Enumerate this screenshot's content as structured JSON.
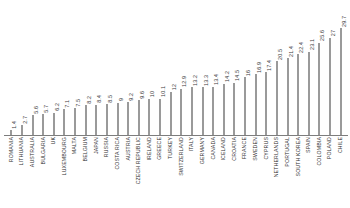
{
  "chart_data": {
    "type": "bar",
    "title": "",
    "xlabel": "",
    "ylabel": "",
    "grid": false,
    "legend": false,
    "ylim": [
      0,
      29.7
    ],
    "orientation": "vertical",
    "bar_color": "#9a9a9a",
    "axis_color": "#7d7d7d",
    "label_rotation": 90,
    "value_labels_shown": true,
    "categories": [
      "ROMANIA",
      "LITHUANIA",
      "AUSTRALIA",
      "BULGARIA",
      "UK",
      "LUXEMBOURG",
      "MALTA",
      "BELGIUM",
      "JAPAN",
      "RUSSIA",
      "COSTA RICA",
      "AUSTRIA",
      "CZECH REPUBLIC",
      "IRELAND",
      "GREECE",
      "TURKEY",
      "SWITZERLAND",
      "ITALY",
      "GERMANY",
      "CANADA",
      "ICELAND",
      "CROATIA",
      "FRANCE",
      "SWEDEN",
      "CYPRUS",
      "NETHERLANDS",
      "PORTUGAL",
      "SOUTH KOREA",
      "SPAIN",
      "COLOMBIA",
      "POLAND",
      "CHILE"
    ],
    "values": [
      1.4,
      2.7,
      5.6,
      5.7,
      6.2,
      7.1,
      7.5,
      8.2,
      8.4,
      8.5,
      9,
      9.2,
      9.6,
      10,
      10.1,
      12,
      12.9,
      13.2,
      13.3,
      13.4,
      14.2,
      14.5,
      16,
      16.9,
      17.4,
      20.5,
      21.4,
      22.4,
      23.1,
      25.6,
      27,
      29.7
    ],
    "value_labels": [
      "1.4",
      "2.7",
      "5.6",
      "5.7",
      "6.2",
      "7.1",
      "7.5",
      "8.2",
      "8.4",
      "8.5",
      "9",
      "9.2",
      "9.6",
      "10",
      "10.1",
      "12",
      "12.9",
      "13.2",
      "13.3",
      "13.4",
      "14.2",
      "14.5",
      "16",
      "16.9",
      "17.4",
      "20.5",
      "21.4",
      "22.4",
      "23.1",
      "25.6",
      "27",
      "29.7"
    ]
  }
}
